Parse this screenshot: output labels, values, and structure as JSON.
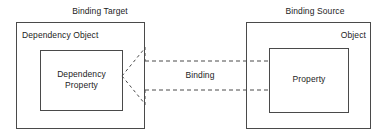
{
  "diagram": {
    "title_left": "Binding Target",
    "title_right": "Binding Source",
    "target": {
      "outer_label": "Dependency Object",
      "inner_label_line1": "Dependency",
      "inner_label_line2": "Property",
      "inner_label": "Dependency Property"
    },
    "source": {
      "outer_label": "Object",
      "inner_label": "Property"
    },
    "connector": {
      "label": "Binding",
      "style": "dashed-block-arrow",
      "direction": "right-to-left"
    },
    "colors": {
      "background": "#ffffff",
      "stroke": "#4a4a4a",
      "text": "#1c1c1c"
    }
  }
}
